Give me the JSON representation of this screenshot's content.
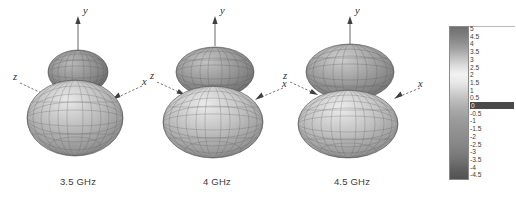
{
  "figure": {
    "background_color": "#ffffff",
    "plot_count": 3
  },
  "plots": [
    {
      "caption": "3.5 GHz",
      "axes": {
        "y": "y",
        "x": "x",
        "z": "z"
      },
      "pattern": {
        "description": "two-lobe 3D radiation pattern mesh",
        "upper_lobe": "small",
        "lower_lobe": "large"
      }
    },
    {
      "caption": "4 GHz",
      "axes": {
        "y": "y",
        "x": "x",
        "z": "z"
      },
      "pattern": {
        "description": "two-lobe 3D radiation pattern mesh",
        "upper_lobe": "medium",
        "lower_lobe": "large"
      }
    },
    {
      "caption": "4.5 GHz",
      "axes": {
        "y": "y",
        "x": "x",
        "z": "z"
      },
      "pattern": {
        "description": "two-lobe 3D radiation pattern mesh",
        "upper_lobe": "large",
        "lower_lobe": "large"
      }
    }
  ],
  "chart_data": {
    "type": "heatmap",
    "title": "",
    "xlabel": "",
    "ylabel": "",
    "colorbar": {
      "orientation": "vertical",
      "colormap": "grayscale",
      "max": 5,
      "min": -4.5,
      "step": 0.5,
      "highlighted_tick": "0",
      "ticks": [
        "5",
        "4.5",
        "4",
        "3.5",
        "3",
        "2.5",
        "2",
        "1.5",
        "1",
        "0.5",
        "0",
        "-0.5",
        "-1",
        "-1.5",
        "-2",
        "-2.5",
        "-3",
        "-3.5",
        "-4",
        "-4.5"
      ]
    },
    "categories": [
      "3.5 GHz",
      "4 GHz",
      "4.5 GHz"
    ],
    "series": [
      {
        "name": "peak gain (dBi)",
        "values": [
          5,
          5,
          5
        ]
      }
    ]
  }
}
